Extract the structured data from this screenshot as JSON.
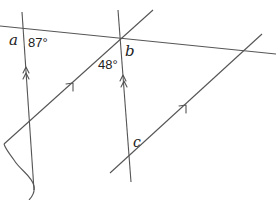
{
  "diagram": {
    "type": "parallel-lines-angles",
    "stroke_color": "#555555",
    "labels": {
      "a": "a",
      "b": "b",
      "c": "c",
      "angle_87": "87°",
      "angle_48": "48°"
    },
    "lines": [
      {
        "name": "transversal",
        "from": [
          0,
          26
        ],
        "to": [
          276,
          54
        ]
      },
      {
        "name": "left-vertical",
        "from": [
          22,
          12
        ],
        "to": [
          34,
          190
        ],
        "marker": "double-arrow"
      },
      {
        "name": "middle-vertical",
        "from": [
          118,
          10
        ],
        "to": [
          131,
          182
        ],
        "marker": "double-arrow"
      },
      {
        "name": "upper-diagonal",
        "from": [
          4,
          144
        ],
        "to": [
          153,
          10
        ],
        "marker": "single-arrow"
      },
      {
        "name": "lower-diagonal",
        "from": [
          110,
          173
        ],
        "to": [
          262,
          34
        ],
        "marker": "single-arrow"
      }
    ]
  }
}
